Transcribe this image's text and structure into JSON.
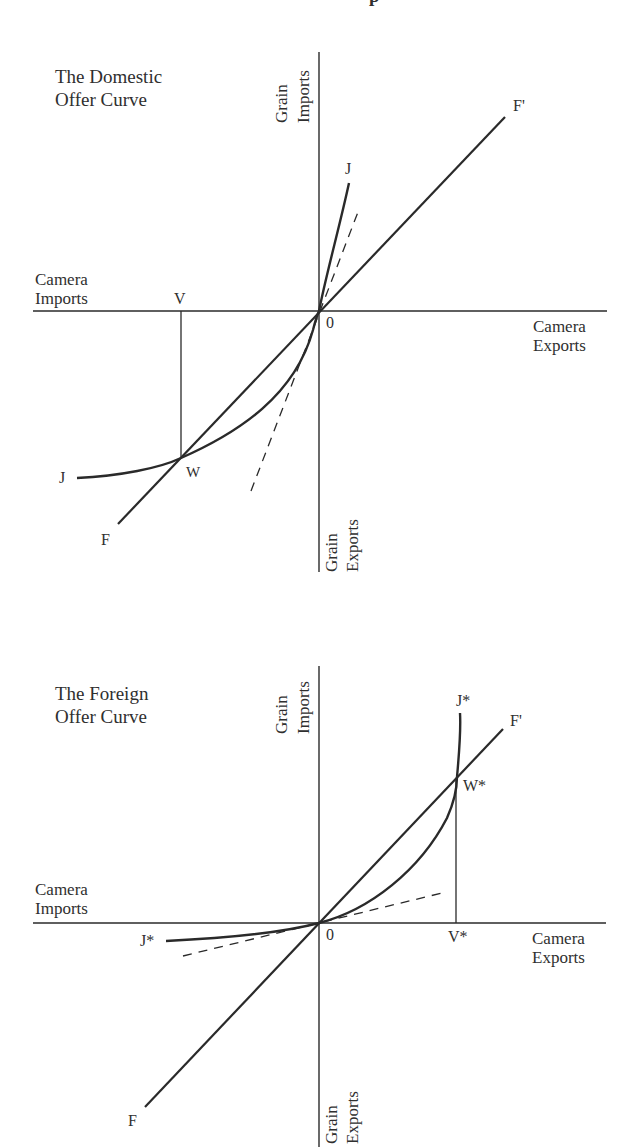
{
  "header_fragment": "p",
  "diagrams": [
    {
      "title_line1": "The Domestic",
      "title_line2": "Offer Curve",
      "y_axis_top_line1": "Grain",
      "y_axis_top_line2": "Imports",
      "y_axis_bottom_line1": "Grain",
      "y_axis_bottom_line2": "Exports",
      "x_axis_left_line1": "Camera",
      "x_axis_left_line2": "Imports",
      "x_axis_right_line1": "Camera",
      "x_axis_right_line2": "Exports",
      "origin": "0",
      "curve_label_upper": "J",
      "curve_label_lower": "J",
      "ray_label_upper": "F'",
      "ray_label_lower": "F",
      "intersection_label": "W",
      "projection_label": "V"
    },
    {
      "title_line1": "The Foreign",
      "title_line2": "Offer Curve",
      "y_axis_top_line1": "Grain",
      "y_axis_top_line2": "Imports",
      "y_axis_bottom_line1": "Grain",
      "y_axis_bottom_line2": "Exports",
      "x_axis_left_line1": "Camera",
      "x_axis_left_line2": "Imports",
      "x_axis_right_line1": "Camera",
      "x_axis_right_line2": "Exports",
      "origin": "0",
      "curve_label_upper": "J*",
      "curve_label_lower": "J*",
      "ray_label_upper": "F'",
      "ray_label_lower": "F",
      "intersection_label": "W*",
      "projection_label": "V*"
    }
  ],
  "colors": {
    "ink": "#2a2a2a",
    "background": "#ffffff"
  }
}
